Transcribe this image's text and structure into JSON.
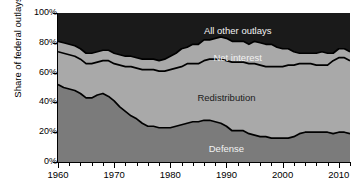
{
  "chart_data": {
    "type": "area",
    "title": "",
    "subtitle": "",
    "xlabel": "",
    "ylabel": "Share of federal outlays",
    "stacked": true,
    "grid": false,
    "legend_position": "inline-annotations",
    "xlim": [
      1960,
      2012
    ],
    "ylim": [
      0,
      100
    ],
    "yticks": [
      "0%",
      "20%",
      "40%",
      "60%",
      "80%",
      "100%"
    ],
    "ytick_values": [
      0,
      20,
      40,
      60,
      80,
      100
    ],
    "xticks": [
      "1960",
      "1970",
      "1980",
      "1990",
      "2000",
      "2010"
    ],
    "xtick_values": [
      1960,
      1970,
      1980,
      1990,
      2000,
      2010
    ],
    "minor_xtick_interval": 2,
    "colors": {
      "defense": "#7b7b7b",
      "redistribution": "#a9a9a9",
      "net_interest": "#a9a9a9",
      "all_other_outlays": "#1a1a1a",
      "outline": "#000000",
      "background": "#ffffff",
      "text": "#000000"
    },
    "x": [
      1960,
      1961,
      1962,
      1963,
      1964,
      1965,
      1966,
      1967,
      1968,
      1969,
      1970,
      1971,
      1972,
      1973,
      1974,
      1975,
      1976,
      1977,
      1978,
      1979,
      1980,
      1981,
      1982,
      1983,
      1984,
      1985,
      1986,
      1987,
      1988,
      1989,
      1990,
      1991,
      1992,
      1993,
      1994,
      1995,
      1996,
      1997,
      1998,
      1999,
      2000,
      2001,
      2002,
      2003,
      2004,
      2005,
      2006,
      2007,
      2008,
      2009,
      2010,
      2011,
      2012
    ],
    "series": [
      {
        "name": "Defense",
        "label": "Defense",
        "color": "#7b7b7b",
        "values": [
          52,
          50,
          49,
          48,
          46,
          43,
          43,
          45,
          46,
          44,
          41,
          37,
          34,
          31,
          29,
          26,
          24,
          24,
          23,
          23,
          23,
          24,
          25,
          26,
          27,
          27,
          28,
          28,
          27,
          26,
          24,
          21,
          21,
          21,
          19,
          18,
          17,
          17,
          16,
          16,
          16,
          16,
          17,
          19,
          20,
          20,
          20,
          20,
          20,
          19,
          20,
          20,
          19
        ]
      },
      {
        "name": "Redistribution",
        "label": "Redistribution",
        "color": "#a9a9a9",
        "values": [
          22,
          23,
          23,
          23,
          23,
          23,
          23,
          22,
          22,
          24,
          25,
          28,
          30,
          33,
          34,
          36,
          38,
          38,
          38,
          38,
          39,
          39,
          39,
          40,
          39,
          39,
          40,
          41,
          42,
          43,
          44,
          46,
          46,
          46,
          47,
          48,
          48,
          47,
          48,
          48,
          48,
          49,
          48,
          47,
          46,
          46,
          45,
          45,
          45,
          49,
          50,
          50,
          49
        ]
      },
      {
        "name": "Net interest",
        "label": "Net interest",
        "color": "#a9a9a9",
        "values": [
          7,
          7,
          7,
          7,
          7,
          7,
          7,
          7,
          7,
          7,
          7,
          7,
          7,
          7,
          7,
          7,
          7,
          7,
          7,
          8,
          9,
          10,
          12,
          11,
          13,
          13,
          14,
          13,
          14,
          15,
          15,
          14,
          14,
          14,
          13,
          15,
          15,
          15,
          15,
          13,
          12,
          11,
          9,
          7,
          7,
          7,
          8,
          9,
          8,
          5,
          6,
          6,
          6
        ]
      },
      {
        "name": "All other outlays",
        "label": "All other outlays",
        "color": "#1a1a1a",
        "values": [
          19,
          20,
          21,
          22,
          24,
          27,
          27,
          26,
          25,
          25,
          27,
          28,
          29,
          29,
          30,
          31,
          31,
          31,
          32,
          31,
          29,
          27,
          24,
          23,
          21,
          21,
          18,
          18,
          17,
          16,
          17,
          19,
          19,
          19,
          21,
          19,
          20,
          21,
          21,
          23,
          24,
          24,
          26,
          27,
          27,
          27,
          27,
          26,
          27,
          27,
          24,
          24,
          26
        ]
      }
    ],
    "annotations": [
      {
        "text": "All other outlays",
        "x": 1992,
        "y": 88,
        "color": "light"
      },
      {
        "text": "Net interest",
        "x": 1992,
        "y": 70,
        "color": "light"
      },
      {
        "text": "Redistribution",
        "x": 1990,
        "y": 43,
        "color": "dark"
      },
      {
        "text": "Defense",
        "x": 1990,
        "y": 9,
        "color": "light"
      }
    ]
  }
}
